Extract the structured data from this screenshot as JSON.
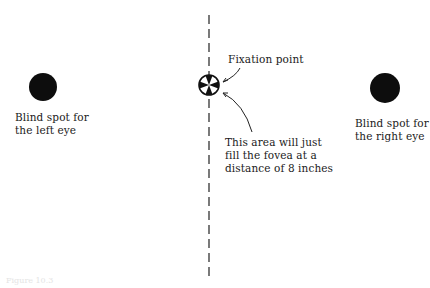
{
  "figure": {
    "left_spot": {
      "label": "Blind spot for\nthe left eye"
    },
    "right_spot": {
      "label": "Blind spot for\nthe right eye"
    },
    "fixation": {
      "label": "Fixation point"
    },
    "fovea_note": {
      "label": "This area will just\nfill the fovea at a\ndistance of 8 inches"
    },
    "caption": "Figure 10.3"
  }
}
